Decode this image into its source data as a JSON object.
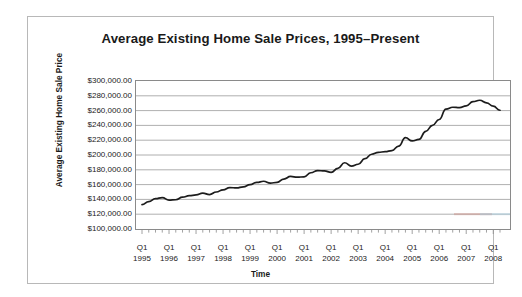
{
  "chart_data": {
    "type": "line",
    "title": "Average Existing Home Sale Prices, 1995–Present",
    "xlabel": "Time",
    "ylabel": "Average Existing Home Sale Price",
    "ylim": [
      100000,
      300000
    ],
    "ytick_labels": [
      "$300,000.00",
      "$280,000.00",
      "$260,000.00",
      "$240,000.00",
      "$220,000.00",
      "$200,000.00",
      "$180,000.00",
      "$160,000.00",
      "$140,000.00",
      "$120,000.00",
      "$100,000.00"
    ],
    "ytick_values": [
      300000,
      280000,
      260000,
      240000,
      220000,
      200000,
      180000,
      160000,
      140000,
      120000,
      100000
    ],
    "xtick_quarter": "Q1",
    "xtick_years": [
      "1995",
      "1996",
      "1997",
      "1998",
      "1999",
      "2000",
      "2001",
      "2002",
      "2003",
      "2004",
      "2005",
      "2006",
      "2007",
      "2008"
    ],
    "grid": "horizontal",
    "legend": "none",
    "line_color": "#1c1c1c",
    "x": [
      "Q1 1995",
      "Q2 1995",
      "Q3 1995",
      "Q4 1995",
      "Q1 1996",
      "Q2 1996",
      "Q3 1996",
      "Q4 1996",
      "Q1 1997",
      "Q2 1997",
      "Q3 1997",
      "Q4 1997",
      "Q1 1998",
      "Q2 1998",
      "Q3 1998",
      "Q4 1998",
      "Q1 1999",
      "Q2 1999",
      "Q3 1999",
      "Q4 1999",
      "Q1 2000",
      "Q2 2000",
      "Q3 2000",
      "Q4 2000",
      "Q1 2001",
      "Q2 2001",
      "Q3 2001",
      "Q4 2001",
      "Q1 2002",
      "Q2 2002",
      "Q3 2002",
      "Q4 2002",
      "Q1 2003",
      "Q2 2003",
      "Q3 2003",
      "Q4 2003",
      "Q1 2004",
      "Q2 2004",
      "Q3 2004",
      "Q4 2004",
      "Q1 2005",
      "Q2 2005",
      "Q3 2005",
      "Q4 2005",
      "Q1 2006",
      "Q2 2006",
      "Q3 2006",
      "Q4 2006",
      "Q1 2007",
      "Q2 2007",
      "Q3 2007",
      "Q4 2007",
      "Q1 2008",
      "Q2 2008"
    ],
    "values": [
      133000,
      137000,
      141000,
      142500,
      139000,
      139500,
      143000,
      145000,
      146000,
      148500,
      146500,
      150000,
      153000,
      156000,
      155500,
      157000,
      160000,
      163000,
      164500,
      162000,
      163000,
      167500,
      171000,
      170000,
      170500,
      176000,
      179000,
      178500,
      176500,
      182000,
      189500,
      185000,
      187500,
      195000,
      201000,
      203500,
      204500,
      206000,
      212000,
      223500,
      219000,
      221000,
      232000,
      240000,
      248000,
      262000,
      264500,
      264000,
      266500,
      272000,
      274000,
      270500,
      266000,
      260500
    ],
    "series_name": "Average Existing Home Sale Price"
  }
}
